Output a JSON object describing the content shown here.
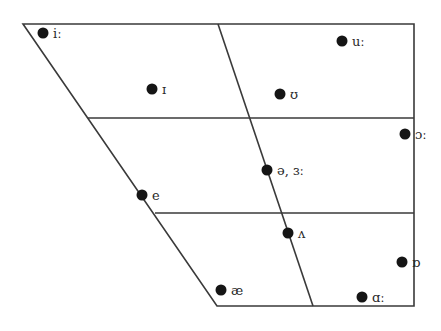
{
  "diagram": {
    "type": "vowel-trapezoid",
    "colors": {
      "line": "#3a3a3a",
      "dot": "#151515",
      "text": "#2a2a2a",
      "background": "#ffffff"
    },
    "outline": [
      [
        23,
        24
      ],
      [
        414,
        24
      ],
      [
        414,
        306
      ],
      [
        217,
        306
      ]
    ],
    "center_line": [
      [
        218,
        24
      ],
      [
        313,
        306
      ]
    ],
    "horizontal_lines": [
      {
        "y": 118,
        "x1": 88,
        "x2": 414
      },
      {
        "y": 213,
        "x1": 155,
        "x2": 414
      }
    ],
    "vowels": [
      {
        "symbol": "iː",
        "x": 43,
        "y": 33
      },
      {
        "symbol": "uː",
        "x": 342,
        "y": 41
      },
      {
        "symbol": "ɪ",
        "x": 152,
        "y": 89
      },
      {
        "symbol": "ʊ",
        "x": 280,
        "y": 94
      },
      {
        "symbol": "ɔː",
        "x": 405,
        "y": 134
      },
      {
        "symbol": "ə, ɜː",
        "x": 267,
        "y": 170
      },
      {
        "symbol": "e",
        "x": 142,
        "y": 195
      },
      {
        "symbol": "ʌ",
        "x": 288,
        "y": 233
      },
      {
        "symbol": "ɒ",
        "x": 402,
        "y": 262
      },
      {
        "symbol": "æ",
        "x": 221,
        "y": 290
      },
      {
        "symbol": "ɑː",
        "x": 362,
        "y": 297
      }
    ]
  }
}
